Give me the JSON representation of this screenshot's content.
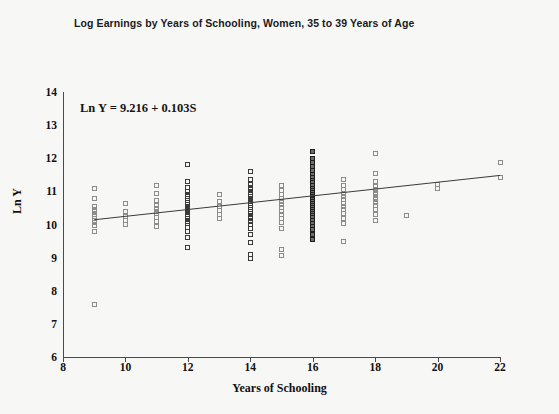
{
  "chart_data": {
    "type": "scatter",
    "title": "Log Earnings by Years of Schooling, Women, 35 to 39 Years of Age",
    "xlabel": "Years of Schooling",
    "ylabel": "Ln Y",
    "xlim": [
      8,
      22
    ],
    "ylim": [
      6,
      14
    ],
    "xticks": [
      8,
      10,
      12,
      14,
      16,
      18,
      20,
      22
    ],
    "yticks": [
      6,
      7,
      8,
      9,
      10,
      11,
      12,
      13,
      14
    ],
    "grid": false,
    "legend": null,
    "annotation": "Ln Y = 9.216 + 0.103S",
    "regression": {
      "intercept": 9.216,
      "slope": 0.103,
      "x_start": 9,
      "x_end": 22,
      "color": "#3a3a3a"
    },
    "marker": {
      "shape": "open-square",
      "size_px": 5,
      "edge_color": "#8c8c8c"
    },
    "columns": [
      {
        "x": 9,
        "values": [
          11.1,
          10.8,
          10.55,
          10.45,
          10.38,
          10.3,
          10.24,
          10.18,
          10.12,
          10.05,
          9.98,
          9.8,
          7.58
        ]
      },
      {
        "x": 10,
        "values": [
          10.62,
          10.4,
          10.25,
          10.12,
          10.0
        ]
      },
      {
        "x": 11,
        "values": [
          11.18,
          10.95,
          10.72,
          10.58,
          10.48,
          10.4,
          10.32,
          10.22,
          10.1,
          9.95
        ]
      },
      {
        "x": 12,
        "values": [
          11.82,
          11.3,
          11.12,
          11.0,
          10.92,
          10.85,
          10.78,
          10.72,
          10.66,
          10.6,
          10.55,
          10.5,
          10.45,
          10.4,
          10.35,
          10.3,
          10.25,
          10.18,
          10.1,
          10.02,
          9.92,
          9.8,
          9.62,
          9.3
        ]
      },
      {
        "x": 13,
        "values": [
          10.92,
          10.7,
          10.55,
          10.42,
          10.3,
          10.18
        ]
      },
      {
        "x": 14,
        "values": [
          11.6,
          11.35,
          11.22,
          11.12,
          11.05,
          10.98,
          10.92,
          10.86,
          10.8,
          10.74,
          10.68,
          10.62,
          10.56,
          10.5,
          10.44,
          10.38,
          10.32,
          10.25,
          10.18,
          10.1,
          10.0,
          9.88,
          9.7,
          9.45,
          9.1,
          8.98
        ]
      },
      {
        "x": 15,
        "values": [
          11.18,
          11.02,
          10.9,
          10.8,
          10.7,
          10.6,
          10.5,
          10.4,
          10.3,
          10.18,
          10.05,
          9.88,
          9.25,
          9.05
        ]
      },
      {
        "x": 16,
        "values": [
          12.2,
          12.0,
          11.88,
          11.76,
          11.64,
          11.52,
          11.42,
          11.34,
          11.26,
          11.18,
          11.1,
          11.04,
          10.98,
          10.92,
          10.86,
          10.8,
          10.74,
          10.68,
          10.62,
          10.56,
          10.5,
          10.44,
          10.38,
          10.32,
          10.26,
          10.2,
          10.12,
          10.04,
          9.95,
          9.84,
          9.7,
          9.55
        ]
      },
      {
        "x": 17,
        "values": [
          11.35,
          11.18,
          11.05,
          10.94,
          10.84,
          10.74,
          10.64,
          10.54,
          10.44,
          10.32,
          10.18,
          10.02,
          9.5
        ]
      },
      {
        "x": 18,
        "values": [
          12.15,
          11.55,
          11.3,
          11.16,
          11.06,
          10.98,
          10.9,
          10.82,
          10.74,
          10.66,
          10.56,
          10.44,
          10.3,
          10.12
        ]
      },
      {
        "x": 19,
        "values": [
          10.28
        ]
      },
      {
        "x": 20,
        "values": [
          11.22,
          11.08
        ]
      },
      {
        "x": 22,
        "values": [
          11.88,
          11.42
        ]
      }
    ]
  }
}
